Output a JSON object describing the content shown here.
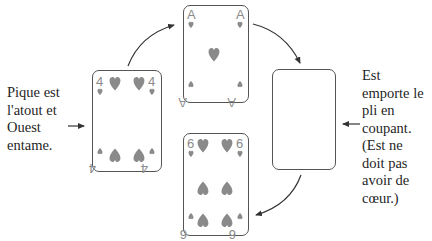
{
  "left_note": {
    "lines": [
      "Pique est",
      "l'atout et",
      "Ouest",
      "entame."
    ]
  },
  "right_note": {
    "lines": [
      "Est",
      "emporte le",
      "pli en",
      "coupant.",
      "(Est ne",
      "doit pas",
      "avoir de",
      "cœur.)"
    ]
  },
  "cards": [
    {
      "id": "west",
      "rank": "4",
      "suit": "heart",
      "position": "left"
    },
    {
      "id": "north",
      "rank": "A",
      "suit": "heart",
      "position": "top"
    },
    {
      "id": "east",
      "rank": "",
      "suit": "",
      "position": "right",
      "face": "blank"
    },
    {
      "id": "south",
      "rank": "6",
      "suit": "heart",
      "position": "bottom"
    }
  ],
  "colors": {
    "pip": "#8a8a8a",
    "outline": "#555555",
    "arrow": "#333333",
    "text": "#1f1f1f"
  }
}
